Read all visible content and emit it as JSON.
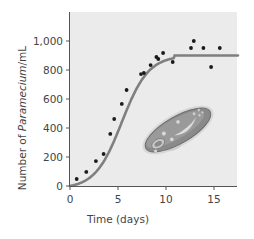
{
  "chart_data": {
    "type": "scatter",
    "title": "",
    "xlabel": "Time (days)",
    "ylabel": "Number of Paramecium/mL",
    "ylabel_parts": {
      "prefix": "Number of ",
      "italic": "Paramecium",
      "suffix": "/mL"
    },
    "xlim": [
      0,
      17.5
    ],
    "ylim": [
      0,
      1150
    ],
    "x_ticks": [
      0,
      5,
      10,
      15
    ],
    "x_tick_labels": [
      "0",
      "5",
      "10",
      "15"
    ],
    "y_ticks": [
      0,
      200,
      400,
      600,
      800,
      1000
    ],
    "y_tick_labels": [
      "0",
      "200",
      "400",
      "600",
      "800",
      "1,000"
    ],
    "grid": false,
    "legend": null,
    "series": [
      {
        "name": "Observed population (data points)",
        "type": "scatter",
        "color": "#1a1a1a",
        "x": [
          0.7,
          1.7,
          2.7,
          3.5,
          4.2,
          4.6,
          5.4,
          5.9,
          7.4,
          7.7,
          8.4,
          9.0,
          9.2,
          9.7,
          10.7,
          12.6,
          12.9,
          13.9,
          14.7,
          15.6
        ],
        "y": [
          48,
          97,
          172,
          221,
          359,
          462,
          566,
          662,
          772,
          779,
          834,
          890,
          876,
          917,
          855,
          952,
          1000,
          952,
          821,
          952
        ]
      },
      {
        "name": "Logistic growth model",
        "type": "line",
        "color": "#7f7f7f",
        "x": [
          0,
          1,
          2,
          3,
          4,
          5,
          6,
          7,
          8,
          9,
          10,
          11,
          12,
          13,
          14,
          15,
          16,
          17.5
        ],
        "y": [
          0,
          20,
          70,
          150,
          260,
          390,
          530,
          660,
          770,
          850,
          895,
          900,
          900,
          900,
          900,
          900,
          900,
          900
        ]
      }
    ],
    "annotations": [
      "Illustration of a Paramecium cell inside the plot area"
    ],
    "carrying_capacity": 900
  },
  "colors": {
    "plot_background": "#ebebeb",
    "axis": "#555555",
    "curve": "#7f7f7f",
    "points": "#1a1a1a",
    "text": "#444444"
  }
}
